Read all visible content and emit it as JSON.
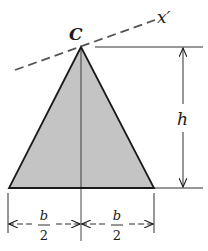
{
  "diagram": {
    "type": "geometry-figure",
    "colors": {
      "fill": "#c4c4c4",
      "stroke": "#1a1a1a",
      "background": "#ffffff"
    },
    "labels": {
      "apex": "C",
      "axis": "x′",
      "height": "h",
      "half_base_left_numerator": "b",
      "half_base_left_denominator": "2",
      "half_base_right_numerator": "b",
      "half_base_right_denominator": "2"
    },
    "geometry": {
      "apex": [
        81,
        47
      ],
      "base_left": [
        9,
        188
      ],
      "base_right": [
        154,
        188
      ],
      "axis_start": [
        15,
        70
      ],
      "axis_end": [
        155,
        20
      ],
      "height_dim_x": 183,
      "base_dim_y": 224
    }
  }
}
